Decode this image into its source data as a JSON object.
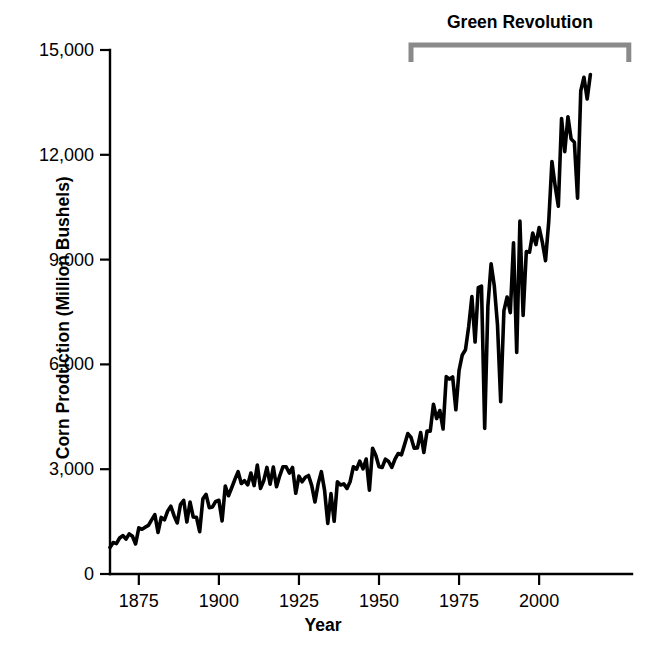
{
  "chart_data": {
    "type": "line",
    "title": "",
    "xlabel": "Year",
    "ylabel": "Corn Production (Million Bushels)",
    "xlim": [
      1866,
      2029
    ],
    "ylim": [
      0,
      15000
    ],
    "grid": false,
    "legend": "none",
    "xticks": [
      1875,
      1900,
      1925,
      1950,
      1975,
      2000
    ],
    "xtick_labels": [
      "1875",
      "1900",
      "1925",
      "1950",
      "1975",
      "2000"
    ],
    "yticks": [
      0,
      3000,
      6000,
      9000,
      12000,
      15000
    ],
    "ytick_labels": [
      "0",
      "3,000",
      "6,000",
      "9,000",
      "12,000",
      "15,000"
    ],
    "series": [
      {
        "name": "Corn Production",
        "color": "#000000",
        "x": [
          1866,
          1867,
          1868,
          1869,
          1870,
          1871,
          1872,
          1873,
          1874,
          1875,
          1876,
          1877,
          1878,
          1879,
          1880,
          1881,
          1882,
          1883,
          1884,
          1885,
          1886,
          1887,
          1888,
          1889,
          1890,
          1891,
          1892,
          1893,
          1894,
          1895,
          1896,
          1897,
          1898,
          1899,
          1900,
          1901,
          1902,
          1903,
          1904,
          1905,
          1906,
          1907,
          1908,
          1909,
          1910,
          1911,
          1912,
          1913,
          1914,
          1915,
          1916,
          1917,
          1918,
          1919,
          1920,
          1921,
          1922,
          1923,
          1924,
          1925,
          1926,
          1927,
          1928,
          1929,
          1930,
          1931,
          1932,
          1933,
          1934,
          1935,
          1936,
          1937,
          1938,
          1939,
          1940,
          1941,
          1942,
          1943,
          1944,
          1945,
          1946,
          1947,
          1948,
          1949,
          1950,
          1951,
          1952,
          1953,
          1954,
          1955,
          1956,
          1957,
          1958,
          1959,
          1960,
          1961,
          1962,
          1963,
          1964,
          1965,
          1966,
          1967,
          1968,
          1969,
          1970,
          1971,
          1972,
          1973,
          1974,
          1975,
          1976,
          1977,
          1978,
          1979,
          1980,
          1981,
          1982,
          1983,
          1984,
          1985,
          1986,
          1987,
          1988,
          1989,
          1990,
          1991,
          1992,
          1993,
          1994,
          1995,
          1996,
          1997,
          1998,
          1999,
          2000,
          2001,
          2002,
          2003,
          2004,
          2005,
          2006,
          2007,
          2008,
          2009,
          2010,
          2011,
          2012,
          2013,
          2014,
          2015,
          2016
        ],
        "values": [
          760,
          900,
          870,
          1030,
          1100,
          1000,
          1150,
          1080,
          860,
          1320,
          1280,
          1340,
          1390,
          1550,
          1700,
          1190,
          1620,
          1550,
          1800,
          1940,
          1670,
          1460,
          1990,
          2110,
          1490,
          2060,
          1630,
          1620,
          1210,
          2150,
          2280,
          1900,
          1920,
          2080,
          2110,
          1520,
          2520,
          2240,
          2470,
          2710,
          2930,
          2590,
          2670,
          2550,
          2890,
          2530,
          3120,
          2450,
          2670,
          3050,
          2570,
          3060,
          2500,
          2810,
          3070,
          3070,
          2890,
          3050,
          2310,
          2800,
          2640,
          2770,
          2820,
          2530,
          2060,
          2580,
          2930,
          2400,
          1450,
          2300,
          1510,
          2640,
          2550,
          2580,
          2450,
          2650,
          3070,
          3000,
          3230,
          3010,
          3290,
          2400,
          3600,
          3400,
          3070,
          3050,
          3290,
          3220,
          3050,
          3290,
          3450,
          3410,
          3710,
          4020,
          3910,
          3600,
          3610,
          4050,
          3480,
          4090,
          4090,
          4860,
          4450,
          4680,
          4150,
          5650,
          5580,
          5640,
          4700,
          5830,
          6270,
          6420,
          7080,
          7940,
          6640,
          8200,
          8240,
          4170,
          7670,
          8880,
          8250,
          7130,
          4930,
          7530,
          7930,
          7480,
          9480,
          6340,
          10100,
          7400,
          9230,
          9210,
          9760,
          9430,
          9920,
          9500,
          8970,
          10090,
          11810,
          11110,
          10530,
          13040,
          12090,
          13090,
          12450,
          12360,
          10760,
          13830,
          14220,
          13600,
          14300
        ]
      }
    ],
    "annotations": [
      {
        "name": "green-revolution",
        "label": "Green Revolution",
        "x_start": 1960,
        "x_end": 2028,
        "style": "bracket",
        "color": "#8a8a8a"
      }
    ]
  },
  "axis_titles": {
    "x": "Year",
    "y": "Corn Production (Million Bushels)"
  },
  "annotation": {
    "label": "Green Revolution"
  }
}
